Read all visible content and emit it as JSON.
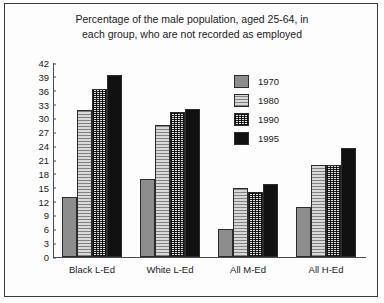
{
  "chart_data": {
    "type": "bar",
    "title": "Percentage of the male population, aged 25-64, in each group, who are not recorded as employed",
    "title_lines": [
      "Percentage of the male population, aged 25-64, in",
      "each group, who are not recorded as employed"
    ],
    "xlabel": "",
    "ylabel": "",
    "ylim": [
      0,
      42
    ],
    "ytick_step": 3,
    "yticks": [
      0,
      3,
      6,
      9,
      12,
      15,
      18,
      21,
      24,
      27,
      30,
      33,
      36,
      39,
      42
    ],
    "grid": false,
    "legend_position": "upper-center-right",
    "categories": [
      "Black L-Ed",
      "White L-Ed",
      "All M-Ed",
      "All H-Ed"
    ],
    "series": [
      {
        "name": "1970",
        "color": "#8d8d8d",
        "fill": "solid-gray",
        "values": [
          13.0,
          16.8,
          6.1,
          10.8
        ]
      },
      {
        "name": "1980",
        "color": "#d8d8d8",
        "fill": "light-hatch",
        "values": [
          31.8,
          28.5,
          15.0,
          20.0
        ]
      },
      {
        "name": "1990",
        "color": "#cfcfcf",
        "fill": "cross-hatch",
        "values": [
          36.3,
          31.3,
          14.0,
          20.0
        ]
      },
      {
        "name": "1995",
        "color": "#111111",
        "fill": "solid-black",
        "values": [
          39.5,
          32.0,
          15.7,
          23.7
        ]
      }
    ]
  },
  "legend": {
    "entries": [
      {
        "label": "1970"
      },
      {
        "label": "1980"
      },
      {
        "label": "1990"
      },
      {
        "label": "1995"
      }
    ]
  }
}
